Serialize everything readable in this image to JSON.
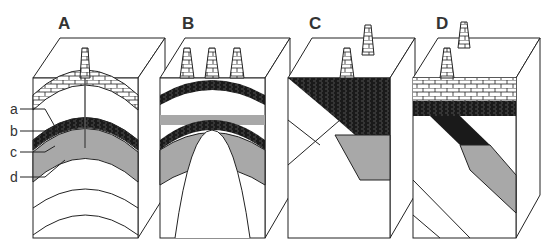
{
  "diagram": {
    "type": "petroleum-trap-block-diagrams",
    "panels": [
      {
        "id": "A",
        "label": "A",
        "derricks": 1
      },
      {
        "id": "B",
        "label": "B",
        "derricks": 3
      },
      {
        "id": "C",
        "label": "C",
        "derricks": 2
      },
      {
        "id": "D",
        "label": "D",
        "derricks": 2
      }
    ],
    "legend_labels": [
      "a",
      "b",
      "c",
      "d"
    ],
    "colors": {
      "line": "#222222",
      "shale": "#1a1a1a",
      "reservoir_gray": "#a8a8a8",
      "gas_dots": "#dcdcdc",
      "background": "#ffffff"
    }
  }
}
